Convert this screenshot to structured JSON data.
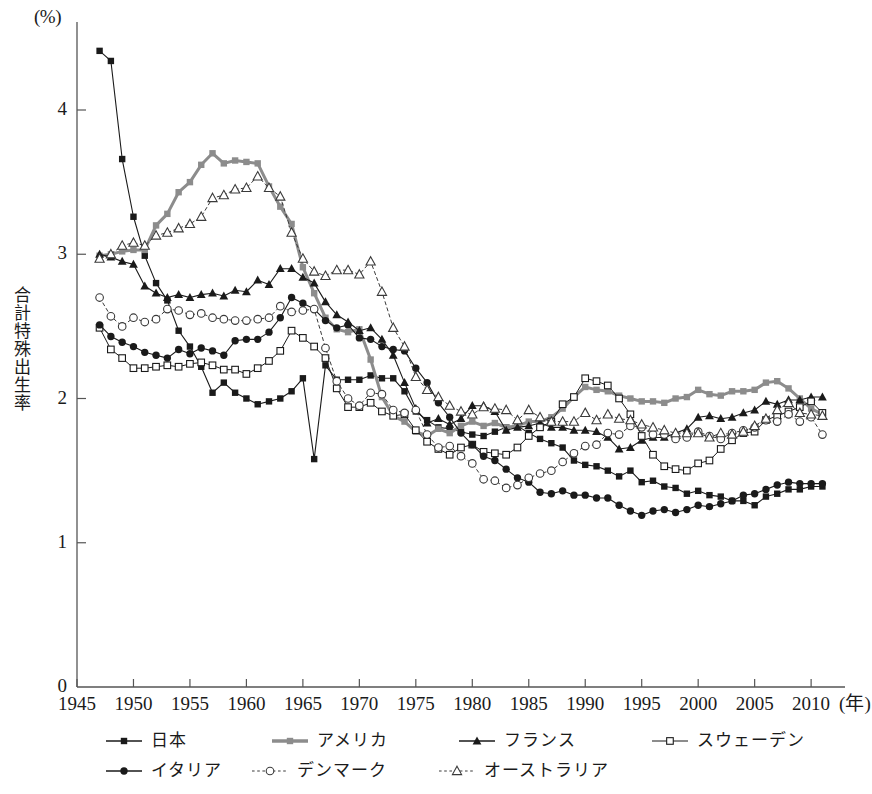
{
  "chart_data": {
    "type": "line",
    "title": "",
    "xlabel": "年",
    "ylabel": "合計特殊出生率",
    "yunit": "(%)",
    "xlim": [
      1945,
      2013
    ],
    "ylim": [
      0,
      4.6
    ],
    "xticks": [
      1945,
      1950,
      1955,
      1960,
      1965,
      1970,
      1975,
      1980,
      1985,
      1990,
      1995,
      2000,
      2005,
      2010
    ],
    "yticks": [
      0,
      1,
      2,
      3,
      4
    ],
    "grid": false,
    "legend_position": "bottom",
    "series": [
      {
        "name": "日本",
        "color": "#1a1a1a",
        "marker": "filled-square",
        "dash": "solid",
        "width": 1.1,
        "x": [
          1947,
          1948,
          1949,
          1950,
          1951,
          1952,
          1953,
          1954,
          1955,
          1956,
          1957,
          1958,
          1959,
          1960,
          1961,
          1962,
          1963,
          1964,
          1965,
          1966,
          1967,
          1968,
          1969,
          1970,
          1971,
          1972,
          1973,
          1974,
          1975,
          1976,
          1977,
          1978,
          1979,
          1980,
          1981,
          1982,
          1983,
          1984,
          1985,
          1986,
          1987,
          1988,
          1989,
          1990,
          1991,
          1992,
          1993,
          1994,
          1995,
          1996,
          1997,
          1998,
          1999,
          2000,
          2001,
          2002,
          2003,
          2004,
          2005,
          2006,
          2007,
          2008,
          2009,
          2010,
          2011
        ],
        "y": [
          4.41,
          4.34,
          3.66,
          3.26,
          2.99,
          2.8,
          2.68,
          2.47,
          2.36,
          2.22,
          2.04,
          2.11,
          2.04,
          2.0,
          1.96,
          1.98,
          2.0,
          2.05,
          2.14,
          1.58,
          2.23,
          2.13,
          2.13,
          2.13,
          2.16,
          2.14,
          2.14,
          2.05,
          1.91,
          1.85,
          1.8,
          1.79,
          1.77,
          1.75,
          1.74,
          1.77,
          1.8,
          1.81,
          1.76,
          1.72,
          1.69,
          1.66,
          1.57,
          1.54,
          1.53,
          1.5,
          1.46,
          1.5,
          1.42,
          1.43,
          1.39,
          1.38,
          1.34,
          1.36,
          1.33,
          1.32,
          1.29,
          1.29,
          1.26,
          1.32,
          1.34,
          1.37,
          1.37,
          1.39,
          1.39
        ]
      },
      {
        "name": "アメリカ",
        "color": "#8c8c8c",
        "marker": "filled-square",
        "dash": "solid",
        "width": 3.0,
        "x": [
          1947,
          1948,
          1949,
          1950,
          1951,
          1952,
          1953,
          1954,
          1955,
          1956,
          1957,
          1958,
          1959,
          1960,
          1961,
          1962,
          1963,
          1964,
          1965,
          1966,
          1967,
          1968,
          1969,
          1970,
          1971,
          1972,
          1973,
          1974,
          1975,
          1976,
          1977,
          1978,
          1979,
          1980,
          1981,
          1982,
          1983,
          1984,
          1985,
          1986,
          1987,
          1988,
          1989,
          1990,
          1991,
          1992,
          1993,
          1994,
          1995,
          1996,
          1997,
          1998,
          1999,
          2000,
          2001,
          2002,
          2003,
          2004,
          2005,
          2006,
          2007,
          2008,
          2009,
          2010,
          2011
        ],
        "y": [
          2.99,
          3.0,
          3.02,
          3.03,
          3.03,
          3.2,
          3.28,
          3.43,
          3.5,
          3.62,
          3.7,
          3.63,
          3.65,
          3.64,
          3.63,
          3.47,
          3.33,
          3.21,
          2.91,
          2.73,
          2.56,
          2.48,
          2.46,
          2.48,
          2.27,
          2.01,
          1.88,
          1.84,
          1.77,
          1.74,
          1.79,
          1.76,
          1.81,
          1.84,
          1.81,
          1.83,
          1.8,
          1.81,
          1.84,
          1.84,
          1.87,
          1.93,
          2.01,
          2.08,
          2.06,
          2.05,
          2.02,
          2.0,
          1.98,
          1.98,
          1.97,
          2.0,
          2.01,
          2.06,
          2.03,
          2.02,
          2.05,
          2.05,
          2.06,
          2.11,
          2.12,
          2.07,
          2.0,
          1.93,
          1.89
        ]
      },
      {
        "name": "フランス",
        "color": "#1a1a1a",
        "marker": "filled-triangle",
        "dash": "solid",
        "width": 1.1,
        "x": [
          1947,
          1948,
          1949,
          1950,
          1951,
          1952,
          1953,
          1954,
          1955,
          1956,
          1957,
          1958,
          1959,
          1960,
          1961,
          1962,
          1963,
          1964,
          1965,
          1966,
          1967,
          1968,
          1969,
          1970,
          1971,
          1972,
          1973,
          1974,
          1975,
          1976,
          1977,
          1978,
          1979,
          1980,
          1981,
          1982,
          1983,
          1984,
          1985,
          1986,
          1987,
          1988,
          1989,
          1990,
          1991,
          1992,
          1993,
          1994,
          1995,
          1996,
          1997,
          1998,
          1999,
          2000,
          2001,
          2002,
          2003,
          2004,
          2005,
          2006,
          2007,
          2008,
          2009,
          2010,
          2011
        ],
        "y": [
          3.0,
          2.98,
          2.95,
          2.93,
          2.78,
          2.73,
          2.7,
          2.72,
          2.7,
          2.72,
          2.73,
          2.71,
          2.75,
          2.74,
          2.82,
          2.79,
          2.9,
          2.9,
          2.84,
          2.8,
          2.67,
          2.58,
          2.53,
          2.47,
          2.49,
          2.41,
          2.3,
          2.11,
          1.93,
          1.83,
          1.86,
          1.82,
          1.86,
          1.95,
          1.95,
          1.91,
          1.78,
          1.8,
          1.81,
          1.83,
          1.8,
          1.8,
          1.78,
          1.78,
          1.77,
          1.73,
          1.65,
          1.66,
          1.71,
          1.73,
          1.73,
          1.76,
          1.79,
          1.87,
          1.88,
          1.86,
          1.87,
          1.9,
          1.92,
          1.98,
          1.96,
          1.99,
          1.99,
          2.01,
          2.01
        ]
      },
      {
        "name": "スウェーデン",
        "color": "#1a1a1a",
        "marker": "open-square",
        "dash": "solid",
        "width": 1.0,
        "x": [
          1947,
          1948,
          1949,
          1950,
          1951,
          1952,
          1953,
          1954,
          1955,
          1956,
          1957,
          1958,
          1959,
          1960,
          1961,
          1962,
          1963,
          1964,
          1965,
          1966,
          1967,
          1968,
          1969,
          1970,
          1971,
          1972,
          1973,
          1974,
          1975,
          1976,
          1977,
          1978,
          1979,
          1980,
          1981,
          1982,
          1983,
          1984,
          1985,
          1986,
          1987,
          1988,
          1989,
          1990,
          1991,
          1992,
          1993,
          1994,
          1995,
          1996,
          1997,
          1998,
          1999,
          2000,
          2001,
          2002,
          2003,
          2004,
          2005,
          2006,
          2007,
          2008,
          2009,
          2010,
          2011
        ],
        "y": [
          2.49,
          2.34,
          2.28,
          2.21,
          2.21,
          2.22,
          2.23,
          2.22,
          2.24,
          2.25,
          2.23,
          2.2,
          2.2,
          2.17,
          2.21,
          2.26,
          2.33,
          2.47,
          2.42,
          2.36,
          2.28,
          2.07,
          1.94,
          1.94,
          1.97,
          1.91,
          1.88,
          1.89,
          1.78,
          1.7,
          1.65,
          1.61,
          1.66,
          1.68,
          1.63,
          1.62,
          1.61,
          1.66,
          1.74,
          1.8,
          1.84,
          1.96,
          2.01,
          2.14,
          2.12,
          2.09,
          2.0,
          1.89,
          1.74,
          1.61,
          1.53,
          1.51,
          1.5,
          1.55,
          1.57,
          1.65,
          1.71,
          1.76,
          1.77,
          1.85,
          1.88,
          1.91,
          1.94,
          1.98,
          1.9
        ]
      },
      {
        "name": "イタリア",
        "color": "#1a1a1a",
        "marker": "filled-circle",
        "dash": "solid",
        "width": 1.1,
        "x": [
          1947,
          1948,
          1949,
          1950,
          1951,
          1952,
          1953,
          1954,
          1955,
          1956,
          1957,
          1958,
          1959,
          1960,
          1961,
          1962,
          1963,
          1964,
          1965,
          1966,
          1967,
          1968,
          1969,
          1970,
          1971,
          1972,
          1973,
          1974,
          1975,
          1976,
          1977,
          1978,
          1979,
          1980,
          1981,
          1982,
          1983,
          1984,
          1985,
          1986,
          1987,
          1988,
          1989,
          1990,
          1991,
          1992,
          1993,
          1994,
          1995,
          1996,
          1997,
          1998,
          1999,
          2000,
          2001,
          2002,
          2003,
          2004,
          2005,
          2006,
          2007,
          2008,
          2009,
          2010,
          2011
        ],
        "y": [
          2.51,
          2.43,
          2.39,
          2.36,
          2.32,
          2.3,
          2.28,
          2.34,
          2.31,
          2.35,
          2.33,
          2.3,
          2.4,
          2.41,
          2.41,
          2.46,
          2.56,
          2.7,
          2.66,
          2.62,
          2.54,
          2.49,
          2.51,
          2.42,
          2.41,
          2.36,
          2.34,
          2.33,
          2.21,
          2.11,
          1.97,
          1.87,
          1.76,
          1.68,
          1.6,
          1.57,
          1.51,
          1.45,
          1.42,
          1.35,
          1.34,
          1.36,
          1.33,
          1.33,
          1.31,
          1.31,
          1.26,
          1.22,
          1.19,
          1.22,
          1.23,
          1.21,
          1.23,
          1.26,
          1.25,
          1.27,
          1.29,
          1.33,
          1.34,
          1.37,
          1.4,
          1.42,
          1.41,
          1.41,
          1.41
        ]
      },
      {
        "name": "デンマーク",
        "color": "#3a3a3a",
        "marker": "open-circle",
        "dash": "dotted",
        "width": 1.0,
        "x": [
          1947,
          1948,
          1949,
          1950,
          1951,
          1952,
          1953,
          1954,
          1955,
          1956,
          1957,
          1958,
          1959,
          1960,
          1961,
          1962,
          1963,
          1964,
          1965,
          1966,
          1967,
          1968,
          1969,
          1970,
          1971,
          1972,
          1973,
          1974,
          1975,
          1976,
          1977,
          1978,
          1979,
          1980,
          1981,
          1982,
          1983,
          1984,
          1985,
          1986,
          1987,
          1988,
          1989,
          1990,
          1991,
          1992,
          1993,
          1994,
          1995,
          1996,
          1997,
          1998,
          1999,
          2000,
          2001,
          2002,
          2003,
          2004,
          2005,
          2006,
          2007,
          2008,
          2009,
          2010,
          2011
        ],
        "y": [
          2.7,
          2.57,
          2.5,
          2.56,
          2.53,
          2.55,
          2.62,
          2.61,
          2.58,
          2.59,
          2.56,
          2.55,
          2.54,
          2.54,
          2.55,
          2.56,
          2.64,
          2.6,
          2.61,
          2.62,
          2.35,
          2.12,
          2.0,
          1.95,
          2.04,
          2.03,
          1.92,
          1.9,
          1.92,
          1.75,
          1.66,
          1.67,
          1.6,
          1.55,
          1.44,
          1.43,
          1.38,
          1.4,
          1.45,
          1.48,
          1.5,
          1.56,
          1.62,
          1.67,
          1.68,
          1.76,
          1.75,
          1.81,
          1.8,
          1.75,
          1.75,
          1.72,
          1.73,
          1.77,
          1.74,
          1.72,
          1.76,
          1.78,
          1.8,
          1.85,
          1.84,
          1.89,
          1.84,
          1.87,
          1.75
        ]
      },
      {
        "name": "オーストラリア",
        "color": "#3a3a3a",
        "marker": "open-triangle",
        "dash": "dotted",
        "width": 1.0,
        "x": [
          1947,
          1948,
          1949,
          1950,
          1951,
          1952,
          1953,
          1954,
          1955,
          1956,
          1957,
          1958,
          1959,
          1960,
          1961,
          1962,
          1963,
          1964,
          1965,
          1966,
          1967,
          1968,
          1969,
          1970,
          1971,
          1972,
          1973,
          1974,
          1975,
          1976,
          1977,
          1978,
          1979,
          1980,
          1981,
          1982,
          1983,
          1984,
          1985,
          1986,
          1987,
          1988,
          1989,
          1990,
          1991,
          1992,
          1993,
          1994,
          1995,
          1996,
          1997,
          1998,
          1999,
          2000,
          2001,
          2002,
          2003,
          2004,
          2005,
          2006,
          2007,
          2008,
          2009,
          2010,
          2011
        ],
        "y": [
          2.97,
          3.0,
          3.06,
          3.08,
          3.06,
          3.13,
          3.15,
          3.18,
          3.21,
          3.26,
          3.39,
          3.41,
          3.45,
          3.46,
          3.54,
          3.46,
          3.4,
          3.15,
          2.97,
          2.88,
          2.85,
          2.89,
          2.89,
          2.86,
          2.95,
          2.74,
          2.49,
          2.36,
          2.15,
          2.06,
          2.01,
          1.95,
          1.91,
          1.89,
          1.94,
          1.93,
          1.92,
          1.85,
          1.92,
          1.87,
          1.84,
          1.84,
          1.84,
          1.9,
          1.85,
          1.89,
          1.86,
          1.85,
          1.82,
          1.8,
          1.78,
          1.76,
          1.76,
          1.76,
          1.73,
          1.76,
          1.75,
          1.77,
          1.81,
          1.86,
          1.92,
          1.97,
          1.9,
          1.89,
          1.88
        ]
      }
    ],
    "legend": [
      {
        "label": "日本",
        "marker": "filled-square",
        "dash": "solid",
        "color": "#1a1a1a",
        "width": 1.4
      },
      {
        "label": "アメリカ",
        "marker": "filled-square",
        "dash": "solid",
        "color": "#8c8c8c",
        "width": 3.4
      },
      {
        "label": "フランス",
        "marker": "filled-triangle",
        "dash": "solid",
        "color": "#1a1a1a",
        "width": 1.4
      },
      {
        "label": "スウェーデン",
        "marker": "open-square",
        "dash": "solid",
        "color": "#1a1a1a",
        "width": 1.2
      },
      {
        "label": "イタリア",
        "marker": "filled-circle",
        "dash": "solid",
        "color": "#1a1a1a",
        "width": 1.4
      },
      {
        "label": "デンマーク",
        "marker": "open-circle",
        "dash": "dotted",
        "color": "#3a3a3a",
        "width": 1.2
      },
      {
        "label": "オーストラリア",
        "marker": "open-triangle",
        "dash": "dotted",
        "color": "#3a3a3a",
        "width": 1.2
      }
    ]
  },
  "axis": {
    "colors": {
      "axis": "#555555",
      "text": "#1a1a1a"
    }
  }
}
